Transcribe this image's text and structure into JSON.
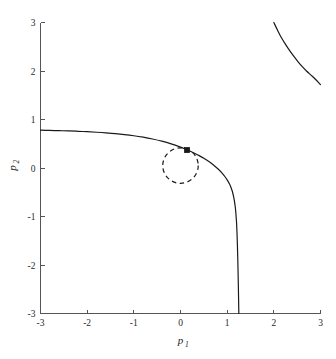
{
  "chart_data": {
    "type": "line",
    "title": "",
    "xlabel": "p_1",
    "ylabel": "p_2",
    "xlabel_base": "p",
    "xlabel_sub": "1",
    "ylabel_base": "p",
    "ylabel_sub": "2",
    "xlim": [
      -3,
      3
    ],
    "ylim": [
      -3,
      3
    ],
    "xticks": [
      -3,
      -2,
      -1,
      0,
      1,
      2,
      3
    ],
    "yticks": [
      -3,
      -2,
      -1,
      0,
      1,
      2,
      3
    ],
    "xticklabels": [
      "-3",
      "-2",
      "-1",
      "0",
      "1",
      "2",
      "3"
    ],
    "yticklabels": [
      "-3",
      "-2",
      "-1",
      "0",
      "1",
      "2",
      "3"
    ],
    "grid": false,
    "legend": null,
    "series": [
      {
        "name": "branch-main",
        "style": "solid",
        "color": "#1a1a1a",
        "x": [
          -3.0,
          -2.8,
          -2.6,
          -2.4,
          -2.2,
          -2.0,
          -1.8,
          -1.6,
          -1.4,
          -1.2,
          -1.0,
          -0.8,
          -0.6,
          -0.4,
          -0.2,
          0.0,
          0.1,
          0.2,
          0.3,
          0.4,
          0.5,
          0.6,
          0.7,
          0.8,
          0.85,
          0.9,
          0.95,
          1.0,
          1.05,
          1.08,
          1.11,
          1.14,
          1.16,
          1.18,
          1.2,
          1.21,
          1.22,
          1.23,
          1.24,
          1.25
        ],
        "y": [
          0.78,
          0.775,
          0.77,
          0.765,
          0.757,
          0.748,
          0.737,
          0.724,
          0.708,
          0.689,
          0.665,
          0.635,
          0.598,
          0.553,
          0.497,
          0.43,
          0.392,
          0.35,
          0.305,
          0.255,
          0.2,
          0.138,
          0.068,
          -0.015,
          -0.062,
          -0.115,
          -0.175,
          -0.245,
          -0.33,
          -0.395,
          -0.48,
          -0.6,
          -0.71,
          -0.86,
          -1.11,
          -1.32,
          -1.6,
          -1.98,
          -2.45,
          -3.0
        ]
      },
      {
        "name": "branch-upper-right",
        "style": "solid",
        "color": "#1a1a1a",
        "x": [
          2.0,
          2.08,
          2.16,
          2.25,
          2.34,
          2.43,
          2.52,
          2.61,
          2.7,
          2.79,
          2.88,
          3.0
        ],
        "y": [
          3.0,
          2.84,
          2.69,
          2.55,
          2.42,
          2.3,
          2.19,
          2.09,
          2.0,
          1.92,
          1.84,
          1.72
        ]
      }
    ],
    "annotations": [
      {
        "name": "dashed-circle",
        "type": "circle",
        "style": "dashed",
        "color": "#1a1a1a",
        "cx": 0.0,
        "cy": 0.05,
        "r": 0.38
      },
      {
        "name": "curve-point-marker",
        "type": "square-marker",
        "color": "#1a1a1a",
        "x": 0.14,
        "y": 0.37,
        "size_px": 5
      }
    ],
    "spines": {
      "left": true,
      "bottom": true,
      "top": false,
      "right": false
    },
    "axis_color": "#555555"
  }
}
